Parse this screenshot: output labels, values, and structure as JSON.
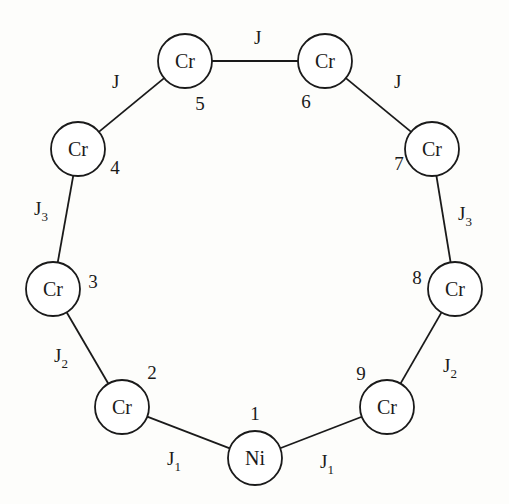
{
  "diagram": {
    "nodes": [
      {
        "id": 1,
        "element": "Ni",
        "index": "1",
        "x": 255,
        "y": 458,
        "ix": 255,
        "iy": 420
      },
      {
        "id": 2,
        "element": "Cr",
        "index": "2",
        "x": 122,
        "y": 407,
        "ix": 152,
        "iy": 379
      },
      {
        "id": 3,
        "element": "Cr",
        "index": "3",
        "x": 53,
        "y": 289,
        "ix": 93,
        "iy": 288
      },
      {
        "id": 4,
        "element": "Cr",
        "index": "4",
        "x": 78,
        "y": 149,
        "ix": 115,
        "iy": 174
      },
      {
        "id": 5,
        "element": "Cr",
        "index": "5",
        "x": 185,
        "y": 61,
        "ix": 200,
        "iy": 110
      },
      {
        "id": 6,
        "element": "Cr",
        "index": "6",
        "x": 325,
        "y": 61,
        "ix": 306,
        "iy": 108
      },
      {
        "id": 7,
        "element": "Cr",
        "index": "7",
        "x": 432,
        "y": 149,
        "ix": 399,
        "iy": 170
      },
      {
        "id": 8,
        "element": "Cr",
        "index": "8",
        "x": 455,
        "y": 289,
        "ix": 417,
        "iy": 284
      },
      {
        "id": 9,
        "element": "Cr",
        "index": "9",
        "x": 387,
        "y": 407,
        "ix": 361,
        "iy": 380
      }
    ],
    "bonds": [
      {
        "from": 1,
        "to": 2,
        "label": "J",
        "sub": "1",
        "lx": 167,
        "ly": 465
      },
      {
        "from": 2,
        "to": 3,
        "label": "J",
        "sub": "2",
        "lx": 54,
        "ly": 362
      },
      {
        "from": 3,
        "to": 4,
        "label": "J",
        "sub": "3",
        "lx": 34,
        "ly": 215
      },
      {
        "from": 4,
        "to": 5,
        "label": "J",
        "sub": "",
        "lx": 112,
        "ly": 88
      },
      {
        "from": 5,
        "to": 6,
        "label": "J",
        "sub": "",
        "lx": 254,
        "ly": 44
      },
      {
        "from": 6,
        "to": 7,
        "label": "J",
        "sub": "",
        "lx": 394,
        "ly": 88
      },
      {
        "from": 7,
        "to": 8,
        "label": "J",
        "sub": "3",
        "lx": 458,
        "ly": 220
      },
      {
        "from": 8,
        "to": 9,
        "label": "J",
        "sub": "2",
        "lx": 443,
        "ly": 372
      },
      {
        "from": 9,
        "to": 1,
        "label": "J",
        "sub": "1",
        "lx": 320,
        "ly": 468
      }
    ],
    "radius": 27,
    "colors": {
      "stroke": "#1a1a1a",
      "background": "#fdfdfb",
      "fill": "#ffffff"
    }
  }
}
